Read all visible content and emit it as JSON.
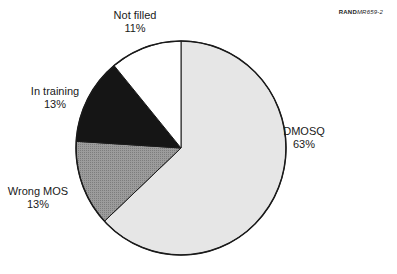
{
  "figure_ref": {
    "bold": "RAND",
    "italic": "MR659-2"
  },
  "chart_data": {
    "type": "pie",
    "title": "",
    "slices": [
      {
        "label": "DMOSQ",
        "value": 63,
        "display": "63%",
        "color": "#e6e6e6"
      },
      {
        "label": "Wrong MOS",
        "value": 13,
        "display": "13%",
        "color": "#9a9a9a"
      },
      {
        "label": "In training",
        "value": 13,
        "display": "13%",
        "color": "#151515"
      },
      {
        "label": "Not filled",
        "value": 11,
        "display": "11%",
        "color": "#ffffff"
      }
    ],
    "start_angle": "12 o'clock",
    "direction": "clockwise",
    "legend": "none (labels beside slices)"
  },
  "labels": {
    "dmosq": {
      "name": "DMOSQ",
      "pct": "63%"
    },
    "wrong_mos": {
      "name": "Wrong MOS",
      "pct": "13%"
    },
    "in_training": {
      "name": "In training",
      "pct": "13%"
    },
    "not_filled": {
      "name": "Not filled",
      "pct": "11%"
    }
  }
}
